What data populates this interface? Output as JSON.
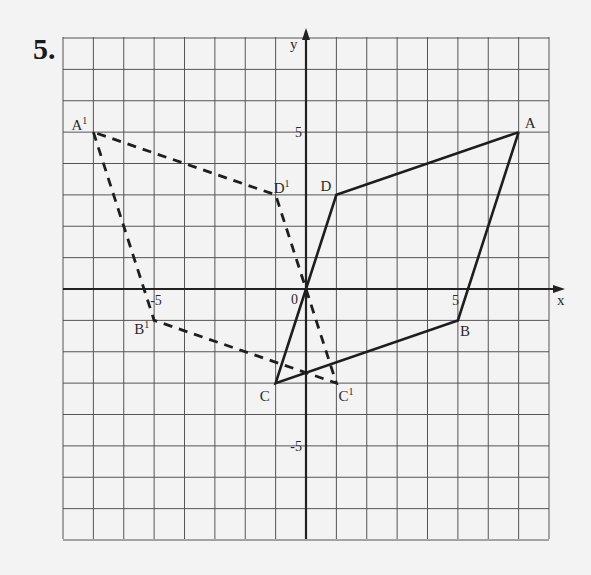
{
  "problem_number": "5.",
  "chart_data": {
    "type": "diagram",
    "title": "",
    "grid": {
      "on": true,
      "xlim": [
        -8,
        8
      ],
      "ylim": [
        -8,
        8
      ],
      "step": 1
    },
    "axes": {
      "xlabel": "x",
      "ylabel": "y",
      "origin_label": "0",
      "x_ticks": [
        {
          "value": -5,
          "label": "-5"
        },
        {
          "value": 5,
          "label": "5"
        }
      ],
      "y_ticks": [
        {
          "value": 5,
          "label": "5"
        },
        {
          "value": -5,
          "label": "-5"
        }
      ]
    },
    "shapes": [
      {
        "name": "ABCD",
        "style": "solid",
        "vertices": [
          {
            "label": "A",
            "x": 7,
            "y": 5
          },
          {
            "label": "B",
            "x": 5,
            "y": -1
          },
          {
            "label": "C",
            "x": -1,
            "y": -3
          },
          {
            "label": "D",
            "x": 1,
            "y": 3
          }
        ]
      },
      {
        "name": "A'B'C'D'",
        "style": "dashed",
        "vertices": [
          {
            "label": "A",
            "prime": "1",
            "x": -7,
            "y": 5
          },
          {
            "label": "B",
            "prime": "1",
            "x": -5,
            "y": -1
          },
          {
            "label": "C",
            "prime": "1",
            "x": 1,
            "y": -3
          },
          {
            "label": "D",
            "prime": "1",
            "x": -1,
            "y": 3
          }
        ]
      }
    ],
    "segments": [
      {
        "from": "A",
        "to": "B",
        "style": "solid"
      },
      {
        "from": "B",
        "to": "C",
        "style": "solid"
      },
      {
        "from": "C",
        "to": "0",
        "style": "solid"
      },
      {
        "from": "0",
        "to": "D",
        "style": "solid"
      },
      {
        "from": "D",
        "to": "A",
        "style": "solid"
      }
    ]
  }
}
